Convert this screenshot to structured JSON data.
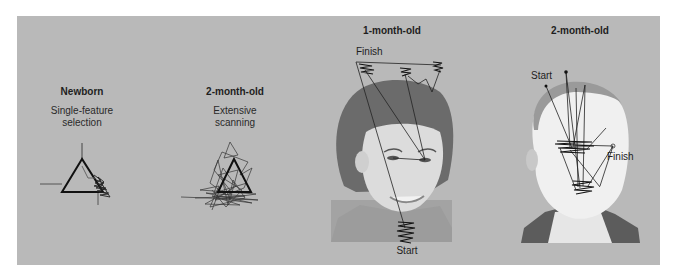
{
  "figure": {
    "panels": [
      {
        "id": "newborn",
        "title": "Newborn",
        "caption_lines": [
          "Single-feature",
          "selection"
        ],
        "stimulus": "triangle",
        "pattern": "single-feature fixation at one corner"
      },
      {
        "id": "two-month-triangle",
        "title": "2-month-old",
        "caption_lines": [
          "Extensive",
          "scanning"
        ],
        "stimulus": "triangle",
        "pattern": "extensive scanning across whole shape"
      },
      {
        "id": "one-month-face",
        "title": "1-month-old",
        "stimulus": "face (woman)",
        "start_label": "Start",
        "finish_label": "Finish"
      },
      {
        "id": "two-month-face",
        "title": "2-month-old",
        "stimulus": "face (man)",
        "start_label": "Start",
        "finish_label": "Finish"
      }
    ]
  },
  "colors": {
    "background": "#b9b9b9",
    "ink": "#1e1e1e",
    "hair": "#6b6b6b",
    "skin": "#dcdcdc",
    "suit": "#5c5c5c"
  }
}
